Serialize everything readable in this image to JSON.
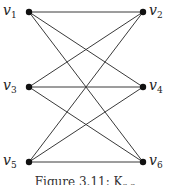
{
  "figure": {
    "caption": "Figure 3.11: K",
    "caption_sub": "3,3"
  },
  "nodes": [
    {
      "id": "v1",
      "name": "v",
      "sub": "1",
      "x": 29,
      "y": 12,
      "side": "left"
    },
    {
      "id": "v2",
      "name": "v",
      "sub": "2",
      "x": 143,
      "y": 12,
      "side": "right"
    },
    {
      "id": "v3",
      "name": "v",
      "sub": "3",
      "x": 29,
      "y": 87,
      "side": "left"
    },
    {
      "id": "v4",
      "name": "v",
      "sub": "4",
      "x": 143,
      "y": 87,
      "side": "right"
    },
    {
      "id": "v5",
      "name": "v",
      "sub": "5",
      "x": 29,
      "y": 162,
      "side": "left"
    },
    {
      "id": "v6",
      "name": "v",
      "sub": "6",
      "x": 143,
      "y": 162,
      "side": "right"
    }
  ],
  "edges": [
    [
      "v1",
      "v2"
    ],
    [
      "v1",
      "v4"
    ],
    [
      "v1",
      "v6"
    ],
    [
      "v3",
      "v2"
    ],
    [
      "v3",
      "v4"
    ],
    [
      "v3",
      "v6"
    ],
    [
      "v5",
      "v2"
    ],
    [
      "v5",
      "v4"
    ],
    [
      "v5",
      "v6"
    ]
  ],
  "colors": {
    "edge": "#3a3a3a",
    "node": "#111111"
  }
}
